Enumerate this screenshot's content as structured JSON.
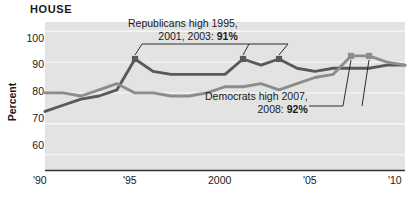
{
  "chart_data": {
    "type": "line",
    "title": "HOUSE",
    "xlabel": "",
    "ylabel": "Percent",
    "xlim": [
      1990,
      2010
    ],
    "ylim": [
      55,
      103
    ],
    "grid": true,
    "legend_position": "none",
    "x_tick_labels": [
      "'90",
      "'95",
      "2000",
      "'05",
      "'10"
    ],
    "x_tick_values": [
      1990,
      1995,
      2000,
      2005,
      2010
    ],
    "y_tick_labels": [
      "100",
      "90",
      "80",
      "70",
      "60"
    ],
    "y_tick_values": [
      100,
      90,
      80,
      70,
      60
    ],
    "x": [
      1990,
      1991,
      1992,
      1993,
      1994,
      1995,
      1996,
      1997,
      1998,
      1999,
      2000,
      2001,
      2002,
      2003,
      2004,
      2005,
      2006,
      2007,
      2008,
      2009,
      2010
    ],
    "series": [
      {
        "name": "Republicans",
        "color": "#595959",
        "values": [
          74,
          76,
          78,
          79,
          81,
          91,
          87,
          86,
          86,
          86,
          86,
          91,
          89,
          91,
          88,
          87,
          88,
          88,
          88,
          89,
          89
        ]
      },
      {
        "name": "Democrats",
        "color": "#8c8c8c",
        "values": [
          80,
          80,
          79,
          81,
          83,
          80,
          80,
          79,
          79,
          80,
          82,
          82,
          83,
          81,
          83,
          85,
          86,
          92,
          92,
          90,
          89
        ]
      }
    ],
    "markers": [
      {
        "x": 1995,
        "y": 91,
        "series": "Republicans"
      },
      {
        "x": 2001,
        "y": 91,
        "series": "Republicans"
      },
      {
        "x": 2003,
        "y": 91,
        "series": "Republicans"
      },
      {
        "x": 2007,
        "y": 92,
        "series": "Democrats"
      },
      {
        "x": 2008,
        "y": 92,
        "series": "Democrats"
      }
    ],
    "annotations": [
      {
        "name": "republicans-high",
        "line1": "Republicans high 1995,",
        "line2_prefix": "2001, 2003: ",
        "line2_value": "91%"
      },
      {
        "name": "democrats-high",
        "line1": "Democrats high 2007,",
        "line2_prefix": "2008: ",
        "line2_value": "92%"
      }
    ],
    "colors": {
      "plot_background": "#e3e3e3",
      "gridline": "#f5f5f5",
      "axis": "#333333",
      "republicans": "#595959",
      "democrats": "#8c8c8c",
      "text": "#1a1a1a"
    }
  }
}
